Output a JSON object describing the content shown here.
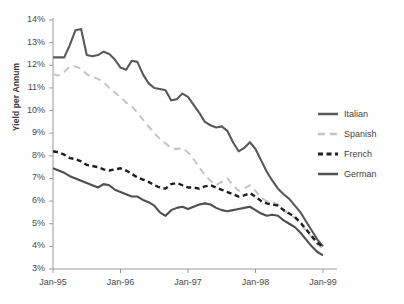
{
  "chart_data": {
    "type": "line",
    "title": "",
    "xlabel": "",
    "ylabel": "Yield per Annum",
    "ylim": [
      3,
      14
    ],
    "ytick_labels": [
      "14%",
      "13%",
      "12%",
      "11%",
      "10%",
      "9%",
      "8%",
      "7%",
      "6%",
      "5%",
      "4%",
      "3%"
    ],
    "ytick_values": [
      14,
      13,
      12,
      11,
      10,
      9,
      8,
      7,
      6,
      5,
      4,
      3
    ],
    "xtick_labels": [
      "Jan-95",
      "Jan-96",
      "Jan-97",
      "Jan-98",
      "Jan-99"
    ],
    "xtick_values": [
      0,
      12,
      24,
      36,
      48
    ],
    "grid": false,
    "legend_position": "right",
    "x": [
      0,
      1,
      2,
      3,
      4,
      5,
      6,
      7,
      8,
      9,
      10,
      11,
      12,
      13,
      14,
      15,
      16,
      17,
      18,
      19,
      20,
      21,
      22,
      23,
      24,
      25,
      26,
      27,
      28,
      29,
      30,
      31,
      32,
      33,
      34,
      35,
      36,
      37,
      38,
      39,
      40,
      41,
      42,
      43,
      44,
      45,
      46,
      47,
      48
    ],
    "series": [
      {
        "name": "Italian",
        "color": "#595959",
        "style": "solid",
        "values": [
          12.35,
          12.35,
          12.35,
          12.9,
          13.55,
          13.6,
          12.45,
          12.4,
          12.45,
          12.6,
          12.5,
          12.25,
          11.9,
          11.8,
          12.2,
          12.15,
          11.6,
          11.2,
          11.0,
          10.95,
          10.9,
          10.45,
          10.5,
          10.75,
          10.6,
          10.25,
          9.9,
          9.5,
          9.35,
          9.25,
          9.3,
          9.1,
          8.6,
          8.2,
          8.35,
          8.6,
          8.3,
          7.8,
          7.3,
          6.9,
          6.55,
          6.3,
          6.1,
          5.8,
          5.5,
          5.1,
          4.7,
          4.3,
          4.0
        ]
      },
      {
        "name": "Spanish",
        "color": "#c4c4c4",
        "style": "dashed",
        "values": [
          11.6,
          11.55,
          11.7,
          11.95,
          11.95,
          11.85,
          11.6,
          11.5,
          11.4,
          11.25,
          11.0,
          10.8,
          10.6,
          10.35,
          10.2,
          9.9,
          9.6,
          9.3,
          9.0,
          8.75,
          8.55,
          8.35,
          8.3,
          8.35,
          8.15,
          7.85,
          7.5,
          7.15,
          6.9,
          6.7,
          6.85,
          7.0,
          6.7,
          6.45,
          6.55,
          6.7,
          6.45,
          6.15,
          6.0,
          5.95,
          5.85,
          5.6,
          5.45,
          5.25,
          5.0,
          4.7,
          4.4,
          4.1,
          3.9
        ]
      },
      {
        "name": "French",
        "color": "#1f1f1f",
        "style": "dash-short",
        "values": [
          8.2,
          8.15,
          8.05,
          7.9,
          7.85,
          7.75,
          7.6,
          7.55,
          7.5,
          7.4,
          7.35,
          7.4,
          7.45,
          7.35,
          7.2,
          7.05,
          6.95,
          6.85,
          6.7,
          6.6,
          6.55,
          6.75,
          6.8,
          6.7,
          6.6,
          6.6,
          6.55,
          6.65,
          6.7,
          6.6,
          6.5,
          6.4,
          6.3,
          6.2,
          6.25,
          6.35,
          6.2,
          6.0,
          5.9,
          5.85,
          5.8,
          5.6,
          5.45,
          5.3,
          5.05,
          4.75,
          4.45,
          4.15,
          4.0
        ]
      },
      {
        "name": "German",
        "color": "#4f4f4f",
        "style": "solid",
        "values": [
          7.45,
          7.35,
          7.25,
          7.1,
          7.0,
          6.9,
          6.8,
          6.7,
          6.6,
          6.75,
          6.7,
          6.5,
          6.4,
          6.3,
          6.2,
          6.2,
          6.05,
          5.95,
          5.8,
          5.5,
          5.35,
          5.6,
          5.7,
          5.75,
          5.65,
          5.75,
          5.85,
          5.9,
          5.85,
          5.7,
          5.6,
          5.55,
          5.6,
          5.65,
          5.7,
          5.75,
          5.6,
          5.45,
          5.35,
          5.4,
          5.35,
          5.15,
          5.0,
          4.85,
          4.6,
          4.3,
          4.0,
          3.75,
          3.6
        ]
      }
    ]
  },
  "legend": {
    "items": [
      {
        "label": "Italian"
      },
      {
        "label": "Spanish"
      },
      {
        "label": "French"
      },
      {
        "label": "German"
      }
    ]
  },
  "axis": {
    "axis_color": "#9a9a9a",
    "label_color": "#4a4a4a"
  }
}
